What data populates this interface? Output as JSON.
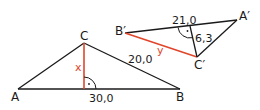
{
  "colors": {
    "line": "#1a1a1a",
    "highlight": "#e0452a"
  },
  "triangle_abc": {
    "vertices": {
      "A": "A",
      "B": "B",
      "C": "C"
    },
    "base_length": "30,0",
    "side_cb_length": "20,0",
    "altitude_label": "x",
    "right_angle_marker": "·"
  },
  "triangle_abc_prime": {
    "vertices": {
      "A": "A′",
      "B": "B′",
      "C": "C′"
    },
    "side_length": "21,0",
    "altitude_length": "6,3",
    "side_label": "y",
    "right_angle_marker": "·"
  }
}
